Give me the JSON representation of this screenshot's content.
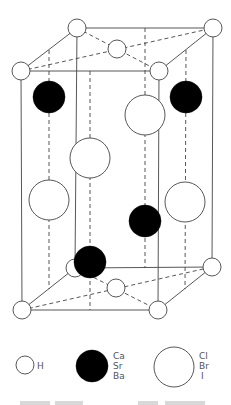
{
  "diagram": {
    "species": {
      "H": {
        "label": "H",
        "fill": "#ffffff",
        "size": "small"
      },
      "M": {
        "labels": [
          "Ca",
          "Sr",
          "Ba"
        ],
        "fill": "#000000",
        "size": "medium"
      },
      "X": {
        "labels": [
          "Cl",
          "Br",
          "I"
        ],
        "fill": "#ffffff",
        "size": "large"
      }
    }
  },
  "legend": {
    "items": [
      {
        "species": "H",
        "lines": [
          "H"
        ]
      },
      {
        "species": "M",
        "lines": [
          "Ca",
          "Sr",
          "Ba"
        ]
      },
      {
        "species": "X",
        "lines": [
          "Cl",
          "Br",
          "I"
        ]
      }
    ]
  }
}
